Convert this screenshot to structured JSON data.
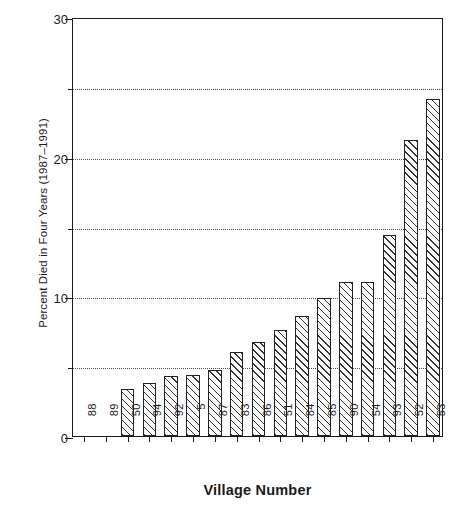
{
  "chart_data": {
    "type": "bar",
    "title": "",
    "xlabel": "Village Number",
    "ylabel": "Percent Died in Four Years (1987–1991)",
    "categories": [
      "88",
      "89",
      "50",
      "94",
      "92",
      "5",
      "87",
      "83",
      "86",
      "51",
      "84",
      "85",
      "90",
      "54",
      "93",
      "52",
      "53"
    ],
    "values": [
      0,
      0,
      3.4,
      3.8,
      4.3,
      4.4,
      4.7,
      6.0,
      6.7,
      7.6,
      8.6,
      9.9,
      11.0,
      11.0,
      14.4,
      21.2,
      24.1
    ],
    "ylim": [
      0,
      30
    ],
    "yticks": [
      0,
      5,
      10,
      15,
      20,
      25,
      30
    ],
    "ytick_labels": [
      "0",
      "",
      "10",
      "",
      "20",
      "",
      "30"
    ],
    "gridlines": [
      5,
      10,
      15,
      20,
      25
    ],
    "grid": true,
    "legend": "none",
    "bar_fill": "diagonal-hatch",
    "bar_edge_color": "#222222",
    "axis_color": "#1a1a1a"
  },
  "axes": {
    "y_title": "Percent Died in Four Years (1987–1991)",
    "x_title": "Village Number"
  }
}
